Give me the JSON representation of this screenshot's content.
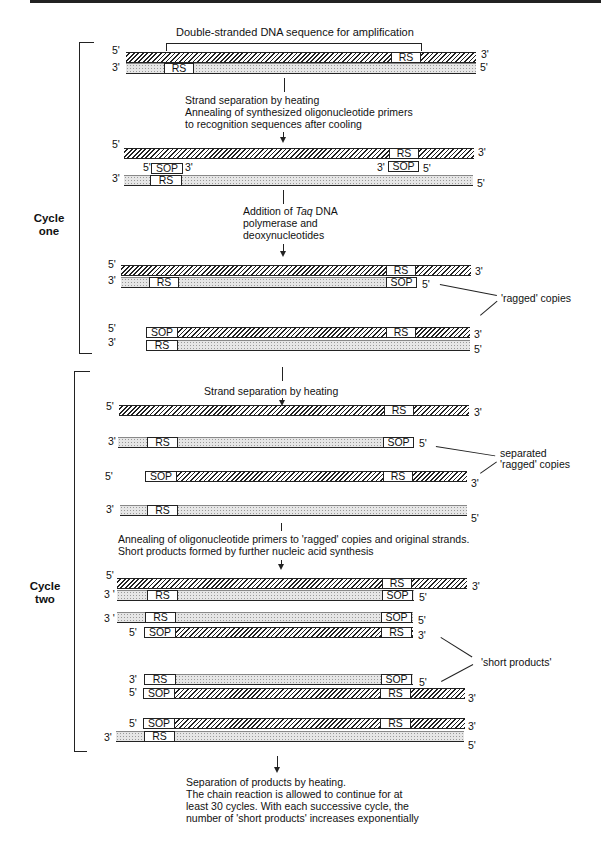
{
  "title": "Double-stranded DNA sequence for amplification",
  "labels": {
    "rs": "RS",
    "sop": "SOP",
    "five": "5'",
    "three": "3'",
    "three_spaced": "3 '"
  },
  "cycles": {
    "one": [
      "Cycle",
      "one"
    ],
    "two": [
      "Cycle",
      "two"
    ]
  },
  "steps": {
    "step1": [
      "Strand separation by heating",
      "Annealing of synthesized oligonucleotide primers",
      "to recognition sequences after cooling"
    ],
    "step2_pre": "Addition of ",
    "step2_italic": "Taq",
    "step2_post": " DNA",
    "step2_lines": [
      "polymerase and",
      "deoxynucleotides"
    ],
    "step3": "Strand separation by heating",
    "step4": [
      "Annealing of oligonucleotide primers to 'ragged' copies and original strands.",
      "Short products formed by further nucleic acid synthesis"
    ],
    "final": [
      "Separation of products by heating.",
      "The chain reaction is allowed to continue for at",
      "least 30 cycles.  With each successive cycle, the",
      "number of 'short products' increases exponentially"
    ]
  },
  "annotations": {
    "ragged": "'ragged' copies",
    "separated": [
      "separated",
      "'ragged' copies"
    ],
    "short_products": "'short products'"
  }
}
